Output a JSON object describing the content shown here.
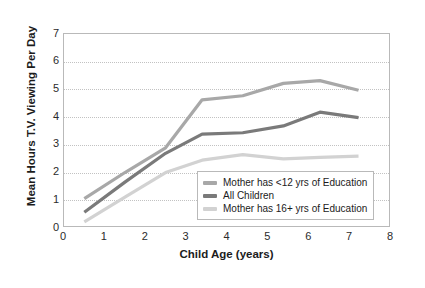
{
  "chart_data": {
    "type": "line",
    "title": "",
    "xlabel": "Child Age (years)",
    "ylabel": "Mean Hours T.V. Viewing Per Day",
    "xlim": [
      0,
      8
    ],
    "ylim": [
      0,
      7
    ],
    "xticks": [
      0,
      1,
      2,
      3,
      4,
      5,
      6,
      7,
      8
    ],
    "yticks": [
      0,
      1,
      2,
      3,
      4,
      5,
      6,
      7
    ],
    "grid": "horizontal-dotted",
    "legend_position": "lower-right-inside",
    "series": [
      {
        "name": "Mother has <12 yrs of Education",
        "color": "#a8a8a8",
        "x": [
          0.5,
          1.5,
          2.5,
          3.4,
          4.4,
          5.4,
          6.3,
          7.25
        ],
        "values": [
          1.0,
          1.95,
          2.85,
          4.6,
          4.75,
          5.2,
          5.3,
          4.95
        ]
      },
      {
        "name": "All Children",
        "color": "#7a7a7a",
        "x": [
          0.5,
          1.5,
          2.5,
          3.4,
          4.4,
          5.4,
          6.3,
          7.25
        ],
        "values": [
          0.5,
          1.6,
          2.65,
          3.35,
          3.4,
          3.65,
          4.15,
          3.95
        ]
      },
      {
        "name": "Mother has 16+ yrs of Education",
        "color": "#d2d2d2",
        "x": [
          0.5,
          1.5,
          2.5,
          3.4,
          4.4,
          5.4,
          6.3,
          7.25
        ],
        "values": [
          0.15,
          1.05,
          1.95,
          2.4,
          2.6,
          2.45,
          2.5,
          2.55
        ]
      }
    ]
  },
  "legend": {
    "items": [
      {
        "label": "Mother has <12 yrs of Education",
        "color": "#a8a8a8"
      },
      {
        "label": "All Children",
        "color": "#7a7a7a"
      },
      {
        "label": "Mother has 16+ yrs of Education",
        "color": "#d2d2d2"
      }
    ]
  },
  "axes": {
    "x_title": "Child Age (years)",
    "y_title": "Mean Hours T.V. Viewing Per Day",
    "x_tick_labels": [
      "0",
      "1",
      "2",
      "3",
      "4",
      "5",
      "6",
      "7",
      "8"
    ],
    "y_tick_labels": [
      "0",
      "1",
      "2",
      "3",
      "4",
      "5",
      "6",
      "7"
    ]
  }
}
